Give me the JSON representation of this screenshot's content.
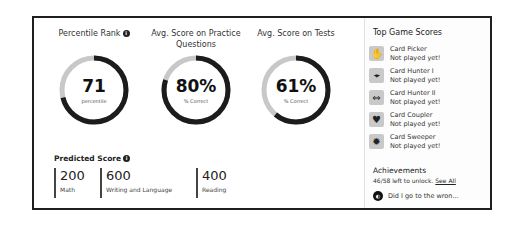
{
  "stats": [
    {
      "title": "Percentile Rank",
      "has_info": true,
      "value": "71",
      "sub": "percentile",
      "percent": 71
    },
    {
      "title": "Avg. Score on Practice Questions",
      "has_info": false,
      "value": "80%",
      "sub": "% Correct",
      "percent": 80
    },
    {
      "title": "Avg. Score on Tests",
      "has_info": false,
      "value": "61%",
      "sub": "% Correct",
      "percent": 61
    }
  ],
  "colors": {
    "ring_fill": "#1c1c1c",
    "ring_track": "#c8c8c8",
    "border": "#1f1f1f"
  },
  "predicted": {
    "title": "Predicted Score",
    "info_icon": "info-icon",
    "items": [
      {
        "score": "200",
        "label": "Math"
      },
      {
        "score": "600",
        "label": "Writing and Language"
      },
      {
        "score": "400",
        "label": "Reading"
      }
    ]
  },
  "games": {
    "title": "Top Game Scores",
    "items": [
      {
        "name": "Card Picker",
        "status": "Not played yet!",
        "icon": "hand-card-icon"
      },
      {
        "name": "Card Hunter I",
        "status": "Not played yet!",
        "icon": "crosshair-icon"
      },
      {
        "name": "Card Hunter II",
        "status": "Not played yet!",
        "icon": "double-arrow-icon"
      },
      {
        "name": "Card Coupler",
        "status": "Not played yet!",
        "icon": "heart-icon"
      },
      {
        "name": "Card Sweeper",
        "status": "Not played yet!",
        "icon": "gear-burst-icon"
      }
    ]
  },
  "achievements": {
    "title": "Achievements",
    "text": "46/58 left to unlock.",
    "link": "See All",
    "latest": "Did I go to the wron..."
  }
}
